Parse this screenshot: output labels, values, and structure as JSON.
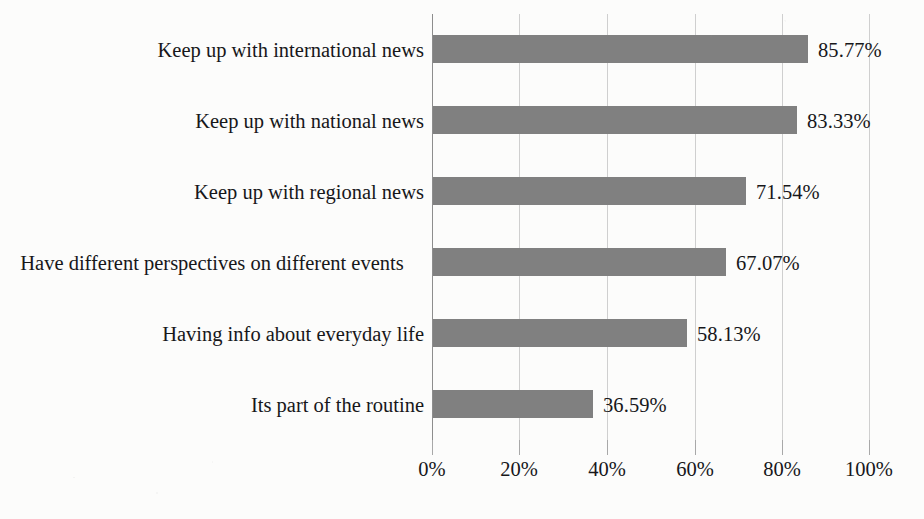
{
  "chart_data": {
    "type": "bar",
    "orientation": "horizontal",
    "title": "",
    "subtitle": "",
    "xlabel": "",
    "ylabel": "",
    "xlim": [
      0,
      100
    ],
    "grid": true,
    "legend": false,
    "categories": [
      "Keep up with international news",
      "Keep up with national news",
      "Keep up with regional news",
      "Have different perspectives on different events",
      "Having info about everyday life",
      "Its part of the routine"
    ],
    "values": [
      85.77,
      83.33,
      71.54,
      67.07,
      58.13,
      36.59
    ],
    "value_labels": [
      "85.77%",
      "83.33%",
      "71.54%",
      "67.07%",
      "58.13%",
      "36.59%"
    ],
    "xticks": [
      0,
      20,
      40,
      60,
      80,
      100
    ],
    "xtick_labels": [
      "0%",
      "20%",
      "40%",
      "60%",
      "80%",
      "100%"
    ],
    "bar_color": "#808080",
    "gridline_color": "#cfcfcf",
    "axis_color": "#8d8d8d",
    "background_color": "#fcfcfb",
    "text_color": "#17171a"
  }
}
